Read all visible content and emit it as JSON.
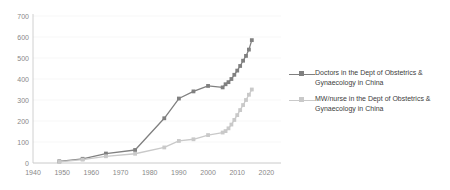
{
  "chart_data": {
    "type": "line",
    "title": "",
    "xlabel": "",
    "ylabel": "",
    "xlim": [
      1940,
      2025
    ],
    "ylim": [
      0,
      700
    ],
    "grid": false,
    "legend_position": "right",
    "x_ticks": [
      "1940",
      "1950",
      "1960",
      "1970",
      "1980",
      "1990",
      "2000",
      "2010",
      "2020"
    ],
    "y_ticks": [
      "0",
      "100",
      "200",
      "300",
      "400",
      "500",
      "600",
      "700"
    ],
    "series": [
      {
        "name": "Doctors in the Dept of Obstetrics & Gynaecology in China",
        "color": "#808080",
        "marker": "square",
        "x": [
          1949,
          1957,
          1965,
          1975,
          1985,
          1990,
          1995,
          2000,
          2005,
          2006,
          2007,
          2008,
          2009,
          2010,
          2011,
          2012,
          2013,
          2014,
          2015
        ],
        "values": [
          8,
          20,
          45,
          62,
          213,
          307,
          341,
          367,
          360,
          375,
          385,
          400,
          420,
          440,
          462,
          487,
          510,
          540,
          585
        ]
      },
      {
        "name": "MW/nurse in the Dept of Obstetrics & Gynaecology in China",
        "color": "#c9c9c9",
        "marker": "square",
        "x": [
          1949,
          1957,
          1965,
          1975,
          1985,
          1990,
          1995,
          2000,
          2005,
          2006,
          2007,
          2008,
          2009,
          2010,
          2011,
          2012,
          2013,
          2014,
          2015
        ],
        "values": [
          5,
          16,
          32,
          44,
          74,
          105,
          113,
          133,
          145,
          152,
          165,
          183,
          205,
          228,
          252,
          276,
          300,
          325,
          350
        ]
      }
    ]
  },
  "legend": {
    "items": [
      {
        "label": "Doctors in the Dept of Obstetrics & Gynaecology in China",
        "color": "#808080"
      },
      {
        "label": "MW/nurse in the Dept of Obstetrics & Gynaecology in China",
        "color": "#c9c9c9"
      }
    ]
  }
}
